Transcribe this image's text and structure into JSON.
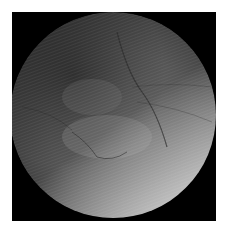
{
  "image": {
    "subject": "retinal fundus photograph",
    "mode": "grayscale",
    "background_color": "#000000",
    "page_background": "#ffffff"
  }
}
